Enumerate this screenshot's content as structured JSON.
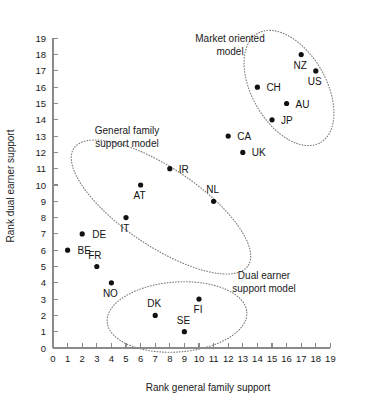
{
  "chart_data": {
    "type": "scatter",
    "title": "",
    "xlabel": "Rank general family support",
    "ylabel": "Rank dual earner support",
    "xlim": [
      0,
      19
    ],
    "ylim": [
      0,
      19
    ],
    "grid": false,
    "legend": "none",
    "xticks": [
      "0",
      "1",
      "2",
      "3",
      "4",
      "5",
      "6",
      "7",
      "8",
      "9",
      "10",
      "11",
      "12",
      "13",
      "14",
      "15",
      "16",
      "17",
      "18",
      "19"
    ],
    "yticks": [
      "0",
      "1",
      "2",
      "3",
      "4",
      "5",
      "6",
      "7",
      "8",
      "9",
      "10",
      "11",
      "12",
      "13",
      "14",
      "15",
      "16",
      "17",
      "18",
      "19"
    ],
    "points": [
      {
        "label": "BE",
        "x": 1,
        "y": 6,
        "lx": 10,
        "ly": 4,
        "anchor": "start"
      },
      {
        "label": "DE",
        "x": 2,
        "y": 7,
        "lx": 10,
        "ly": 4,
        "anchor": "start"
      },
      {
        "label": "FR",
        "x": 3,
        "y": 5,
        "lx": -2,
        "ly": -8,
        "anchor": "middle"
      },
      {
        "label": "NO",
        "x": 4,
        "y": 4,
        "lx": -1,
        "ly": 14,
        "anchor": "middle"
      },
      {
        "label": "IT",
        "x": 5,
        "y": 8,
        "lx": -1,
        "ly": 14,
        "anchor": "middle"
      },
      {
        "label": "AT",
        "x": 6,
        "y": 10,
        "lx": -1,
        "ly": 14,
        "anchor": "middle"
      },
      {
        "label": "DK",
        "x": 7,
        "y": 2,
        "lx": -1,
        "ly": -8,
        "anchor": "middle"
      },
      {
        "label": "IR",
        "x": 8,
        "y": 11,
        "lx": 9,
        "ly": 4,
        "anchor": "start"
      },
      {
        "label": "SE",
        "x": 9,
        "y": 1,
        "lx": -1,
        "ly": -8,
        "anchor": "middle"
      },
      {
        "label": "FI",
        "x": 10,
        "y": 3,
        "lx": -1,
        "ly": 14,
        "anchor": "middle"
      },
      {
        "label": "NL",
        "x": 11,
        "y": 9,
        "lx": -1,
        "ly": -8,
        "anchor": "middle"
      },
      {
        "label": "CA",
        "x": 12,
        "y": 13,
        "lx": 9,
        "ly": 4,
        "anchor": "start"
      },
      {
        "label": "UK",
        "x": 13,
        "y": 12,
        "lx": 9,
        "ly": 4,
        "anchor": "start"
      },
      {
        "label": "CH",
        "x": 14,
        "y": 16,
        "lx": 9,
        "ly": 4,
        "anchor": "start"
      },
      {
        "label": "JP",
        "x": 15,
        "y": 14,
        "lx": 9,
        "ly": 4,
        "anchor": "start"
      },
      {
        "label": "AU",
        "x": 16,
        "y": 15,
        "lx": 9,
        "ly": 4,
        "anchor": "start"
      },
      {
        "label": "NZ",
        "x": 17,
        "y": 18,
        "lx": -1,
        "ly": 14,
        "anchor": "middle"
      },
      {
        "label": "US",
        "x": 18,
        "y": 17,
        "lx": -1,
        "ly": 14,
        "anchor": "middle"
      }
    ],
    "clusters": [
      {
        "name": "market-oriented",
        "label_line1": "Market oriented",
        "label_line2": "model",
        "label_x": 230,
        "label_y": 42,
        "ellipse": {
          "cx": 289,
          "cy": 88,
          "rx": 37,
          "ry": 63,
          "rotate": -30
        }
      },
      {
        "name": "general-family-support",
        "label_line1": "General family",
        "label_line2": "support model",
        "label_x": 127,
        "label_y": 134,
        "ellipse": {
          "cx": 161,
          "cy": 207,
          "rx": 39,
          "ry": 105,
          "rotate": -56
        }
      },
      {
        "name": "dual-earner-support",
        "label_line1": "Dual earner",
        "label_line2": "support model",
        "label_x": 264,
        "label_y": 279,
        "ellipse": {
          "cx": 177,
          "cy": 317,
          "rx": 70,
          "ry": 35,
          "rotate": -4
        }
      }
    ]
  },
  "axes": {
    "x_origin_px": 53,
    "y_origin_px": 348,
    "x_unit_px": 14.6,
    "y_unit_px": 16.3
  }
}
